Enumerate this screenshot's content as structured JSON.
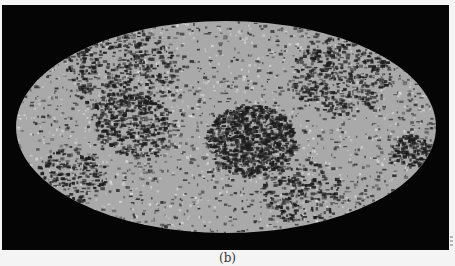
{
  "figure": {
    "caption": "(b)",
    "projection": "mollweide"
  },
  "panel": {
    "background": "#050505"
  },
  "map": {
    "center": [
      226,
      127
    ],
    "rx": 210,
    "ry": 106,
    "base_color": "#a9a9a9",
    "dark_color": "#1c1c1c",
    "light_color": "#e2e2e2",
    "clusters": [
      {
        "cx": 250,
        "cy": 140,
        "r": 45,
        "density": 900
      },
      {
        "cx": 135,
        "cy": 125,
        "r": 40,
        "density": 350
      },
      {
        "cx": 120,
        "cy": 70,
        "r": 55,
        "density": 450
      },
      {
        "cx": 340,
        "cy": 75,
        "r": 50,
        "density": 400
      },
      {
        "cx": 410,
        "cy": 150,
        "r": 20,
        "density": 150
      },
      {
        "cx": 300,
        "cy": 190,
        "r": 40,
        "density": 220
      },
      {
        "cx": 70,
        "cy": 175,
        "r": 35,
        "density": 200
      }
    ],
    "background_specks": 1800,
    "light_specks": 900
  }
}
